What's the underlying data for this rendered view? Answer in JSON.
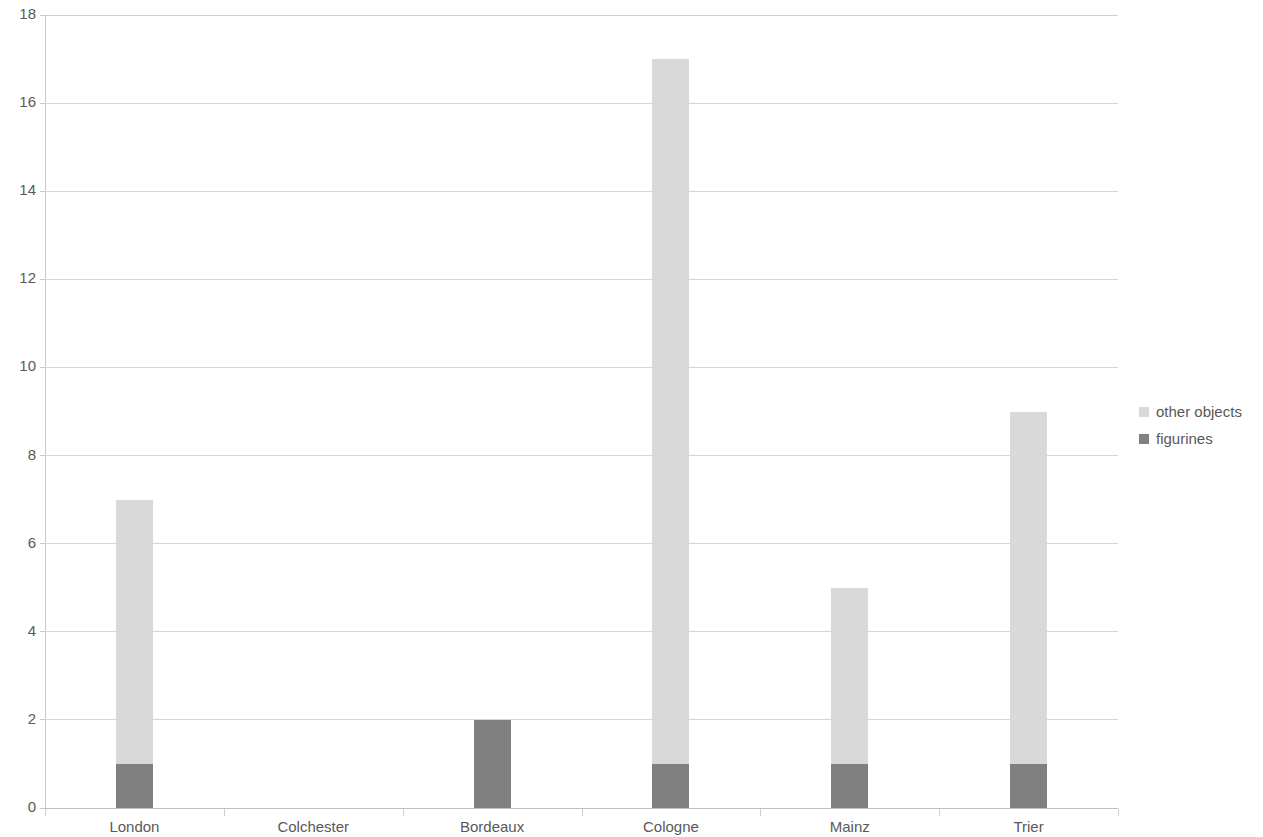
{
  "chart_data": {
    "type": "bar",
    "subtype": "stacked-column",
    "title": "",
    "subtitle": "",
    "xlabel": "",
    "ylabel": "",
    "categories": [
      "London",
      "Colchester",
      "Bordeaux",
      "Cologne",
      "Mainz",
      "Trier"
    ],
    "series": [
      {
        "name": "figurines",
        "values": [
          1,
          0,
          2,
          1,
          1,
          1
        ],
        "color": "#808080"
      },
      {
        "name": "other objects",
        "values": [
          6,
          0,
          0,
          16,
          4,
          8
        ],
        "color": "#d9d9d9"
      }
    ],
    "stack_order": [
      "figurines",
      "other objects"
    ],
    "totals": [
      7,
      0,
      2,
      17,
      5,
      9
    ],
    "ylim": [
      0,
      18
    ],
    "y_ticks": [
      0,
      2,
      4,
      6,
      8,
      10,
      12,
      14,
      16,
      18
    ],
    "y_tick_labels": [
      "0",
      "2",
      "4",
      "6",
      "8",
      "10",
      "12",
      "14",
      "16",
      "18"
    ],
    "grid": true,
    "grid_axis": "y",
    "legend_position": "right",
    "legend_entries": [
      {
        "label": "other objects",
        "color": "#d9d9d9"
      },
      {
        "label": "figurines",
        "color": "#808080"
      }
    ]
  },
  "colors": {
    "other_objects": "#d9d9d9",
    "figurines": "#808080",
    "gridline": "#d6d6d6",
    "axis": "#c8c8c8",
    "text": "#595959",
    "background": "#ffffff"
  }
}
